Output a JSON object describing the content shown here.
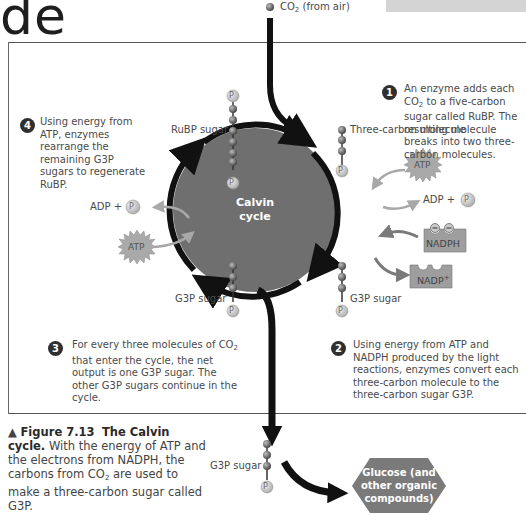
{
  "heading_fragment": "de",
  "figure": {
    "center_label_line1": "Calvin",
    "center_label_line2": "cycle",
    "co2_input": {
      "formula": "CO",
      "subscript": "2",
      "suffix": " (from air)"
    },
    "molecule_labels": {
      "rubp": "RuBP sugar",
      "three_carbon": "Three-carbon molecule",
      "g3p_left": "G3P sugar",
      "g3p_right": "G3P sugar",
      "g3p_output": "G3P sugar",
      "phosphate": "P"
    },
    "energy_labels": {
      "atp_left": "ATP",
      "atp_right": "ATP",
      "adp_left": "ADP +",
      "adp_right": "ADP +",
      "nadph": "NADPH",
      "nadp": "NADP",
      "nadp_sup": "+"
    },
    "output_product": {
      "line1": "Glucose (and",
      "line2": "other organic",
      "line3": "compounds)"
    },
    "steps": [
      {
        "number": "1",
        "text_a": "An enzyme adds each CO",
        "sub": "2",
        "text_b": " to a five-carbon sugar called RuBP. The resulting molecule breaks into two three-carbon molecules."
      },
      {
        "number": "2",
        "text": "Using energy from ATP and NADPH produced by the light reactions, enzymes convert each three-carbon molecule to the three-carbon sugar G3P."
      },
      {
        "number": "3",
        "text_a": "For every three molecules of CO",
        "sub": "2",
        "text_b": " that enter the cycle, the net output is one G3P sugar. The other G3P sugars continue in the cycle."
      },
      {
        "number": "4",
        "text": "Using energy from ATP, enzymes rearrange the remaining G3P sugars to regenerate RuBP."
      }
    ],
    "caption": {
      "marker": "▲",
      "figure_number": "Figure 7.13",
      "title": "The Calvin cycle.",
      "body_a": " With the energy of ATP and the electrons from NADPH, the carbons from CO",
      "sub": "2",
      "body_b": " are used to make a three-carbon sugar called G3P."
    },
    "colors": {
      "cycle_fill": "#6f6f6f",
      "arrow": "#111111",
      "energy_arrow": "#a8a8a8",
      "nadph_arrow": "#7a7a7a",
      "carbon_ball": "#6a6a6a",
      "phosphate_ball": "#cfcfcf",
      "hexagon": "#7a7a7a"
    }
  }
}
